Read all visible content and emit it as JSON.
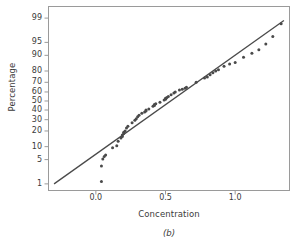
{
  "figure": {
    "caption": "(b)",
    "axis_color": "#9a9a9a",
    "point_color": "#4a4a4a",
    "line_color": "#4a4a4a",
    "background": "#ffffff"
  },
  "chart_data": {
    "type": "scatter",
    "title": "",
    "subtitle": "",
    "xlabel": "Concentration",
    "ylabel": "Percentage",
    "caption": "(b)",
    "grid": false,
    "legend": false,
    "legend_position": "none",
    "plot_kind": "normal-probability-plot",
    "xlim": [
      -0.34,
      1.39
    ],
    "ylim_percent": [
      0.6,
      99.6
    ],
    "y_scale": "probability",
    "xticks": [
      0.0,
      0.5,
      1.0
    ],
    "xtick_labels": [
      "0.0",
      "0.5",
      "1.0"
    ],
    "yticks": [
      1,
      5,
      10,
      20,
      30,
      40,
      50,
      60,
      70,
      80,
      90,
      95,
      99
    ],
    "ytick_labels": [
      "1",
      "5",
      "10",
      "20",
      "30",
      "40",
      "50",
      "60",
      "70",
      "80",
      "90",
      "95",
      "99"
    ],
    "reference_line": {
      "label": "normal reference line",
      "x": [
        -0.3,
        1.35
      ],
      "percent": [
        1.0,
        98.8
      ]
    },
    "series": [
      {
        "name": "Concentration sample quantiles",
        "marker": "circle",
        "x": [
          0.04,
          0.04,
          0.05,
          0.06,
          0.07,
          0.12,
          0.15,
          0.16,
          0.18,
          0.19,
          0.19,
          0.2,
          0.2,
          0.21,
          0.22,
          0.23,
          0.26,
          0.28,
          0.29,
          0.3,
          0.31,
          0.33,
          0.35,
          0.36,
          0.36,
          0.38,
          0.41,
          0.42,
          0.42,
          0.43,
          0.46,
          0.49,
          0.5,
          0.5,
          0.51,
          0.52,
          0.54,
          0.56,
          0.57,
          0.6,
          0.62,
          0.64,
          0.65,
          0.72,
          0.78,
          0.8,
          0.82,
          0.84,
          0.86,
          0.88,
          0.92,
          0.96,
          1.0,
          1.06,
          1.12,
          1.17,
          1.22,
          1.27,
          1.33
        ],
        "percent": [
          1.2,
          3.4,
          5.2,
          6.0,
          6.5,
          9.5,
          10.5,
          13.0,
          15.0,
          16.0,
          17.0,
          18.0,
          19.0,
          20.0,
          22.5,
          24.0,
          27.0,
          29.5,
          31.0,
          33.0,
          34.5,
          36.5,
          38.0,
          39.0,
          40.0,
          41.0,
          44.0,
          45.0,
          46.0,
          47.0,
          48.5,
          51.0,
          52.0,
          53.0,
          54.0,
          55.0,
          57.0,
          59.0,
          60.0,
          62.0,
          63.0,
          64.0,
          65.0,
          70.0,
          74.0,
          75.0,
          77.0,
          78.5,
          80.0,
          81.0,
          83.5,
          85.0,
          86.0,
          89.0,
          91.0,
          92.5,
          94.5,
          96.5,
          98.5
        ]
      }
    ]
  }
}
